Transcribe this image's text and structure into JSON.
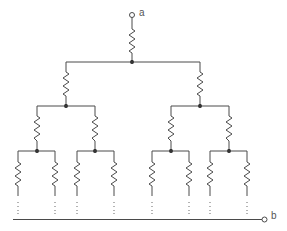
{
  "diagram": {
    "type": "infinite-binary-tree-resistor-network",
    "terminals": [
      {
        "id": "a",
        "label": "a",
        "position": "top"
      },
      {
        "id": "b",
        "label": "b",
        "position": "bottom-right"
      }
    ],
    "levels": [
      {
        "level": 1,
        "resistor_count": 1
      },
      {
        "level": 2,
        "resistor_count": 2
      },
      {
        "level": 3,
        "resistor_count": 4
      },
      {
        "level": 4,
        "resistor_count": 8
      }
    ],
    "continuation": "dotted lines indicate the tree continues infinitely toward terminal b",
    "colors": {
      "wire": "#4a4a4a",
      "node": "#1e1e1e",
      "background": "#ffffff"
    }
  }
}
